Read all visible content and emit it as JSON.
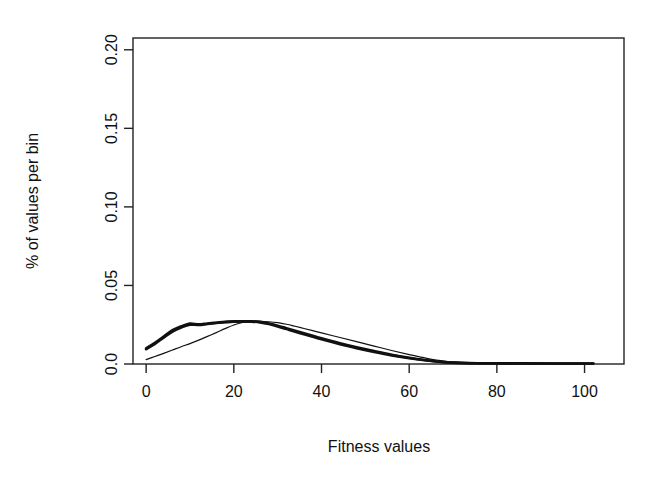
{
  "chart_data": {
    "type": "line",
    "title": "",
    "subtitle": "",
    "xlabel": "Fitness values",
    "ylabel": "% of values per bin",
    "xlim": [
      -3,
      109
    ],
    "ylim": [
      0.0,
      0.2075
    ],
    "grid": false,
    "legend": "none",
    "xticks": [
      0,
      20,
      40,
      60,
      80,
      100
    ],
    "xtick_labels": [
      "0",
      "20",
      "40",
      "60",
      "80",
      "100"
    ],
    "yticks": [
      0.0,
      0.05,
      0.1,
      0.15,
      0.2
    ],
    "ytick_labels": [
      "0.0",
      "0.05",
      "0.10",
      "0.15",
      "0.20"
    ],
    "line_color": "#111111",
    "frame_color": "#222222",
    "background": "#ffffff",
    "series": [
      {
        "name": "thick-bundle-curve-a",
        "style": "thick",
        "x": [
          0,
          2,
          4,
          6,
          8,
          10,
          12,
          14,
          16,
          18,
          20,
          22,
          24,
          26,
          28,
          30,
          32,
          34,
          36,
          38,
          40,
          44,
          48,
          52,
          56,
          60,
          64,
          68,
          72,
          76,
          80,
          86,
          92,
          98,
          102
        ],
        "values": [
          0.01,
          0.0135,
          0.0175,
          0.0215,
          0.024,
          0.0258,
          0.0252,
          0.0258,
          0.0263,
          0.0268,
          0.0271,
          0.0272,
          0.0272,
          0.0268,
          0.0258,
          0.0244,
          0.0228,
          0.0212,
          0.0196,
          0.018,
          0.0164,
          0.0134,
          0.0107,
          0.0082,
          0.0059,
          0.004,
          0.0024,
          0.0012,
          0.0007,
          0.0005,
          0.0004,
          0.0004,
          0.0003,
          0.0003,
          0.0003
        ]
      },
      {
        "name": "thick-bundle-curve-b",
        "style": "thick",
        "x": [
          0,
          2,
          4,
          6,
          8,
          10,
          12,
          14,
          16,
          18,
          20,
          22,
          24,
          26,
          28,
          30,
          32,
          34,
          36,
          38,
          40,
          44,
          48,
          52,
          56,
          60,
          64,
          68,
          72,
          76,
          80,
          86,
          92,
          98,
          102
        ],
        "values": [
          0.0094,
          0.0128,
          0.0168,
          0.0206,
          0.0232,
          0.025,
          0.0248,
          0.0255,
          0.0261,
          0.0266,
          0.027,
          0.0271,
          0.027,
          0.0265,
          0.0254,
          0.0239,
          0.0222,
          0.0205,
          0.0189,
          0.0173,
          0.0157,
          0.0128,
          0.0101,
          0.0077,
          0.0055,
          0.0037,
          0.0022,
          0.0011,
          0.0006,
          0.0004,
          0.0004,
          0.0003,
          0.0003,
          0.0003,
          0.0003
        ]
      },
      {
        "name": "thin-curve",
        "style": "thin",
        "x": [
          0,
          2,
          4,
          6,
          8,
          10,
          12,
          14,
          16,
          18,
          20,
          22,
          24,
          26,
          28,
          30,
          32,
          34,
          36,
          38,
          40,
          44,
          48,
          52,
          56,
          60,
          64,
          68,
          72,
          76,
          80,
          86,
          92,
          98,
          102
        ],
        "values": [
          0.0028,
          0.0048,
          0.0068,
          0.0089,
          0.011,
          0.013,
          0.0152,
          0.0176,
          0.02,
          0.0225,
          0.0248,
          0.0264,
          0.0271,
          0.0272,
          0.0269,
          0.0263,
          0.0253,
          0.024,
          0.0226,
          0.0212,
          0.0198,
          0.017,
          0.0142,
          0.0114,
          0.0086,
          0.006,
          0.0036,
          0.0018,
          0.0009,
          0.0006,
          0.0005,
          0.0004,
          0.0003,
          0.0003,
          0.0003
        ]
      }
    ]
  }
}
